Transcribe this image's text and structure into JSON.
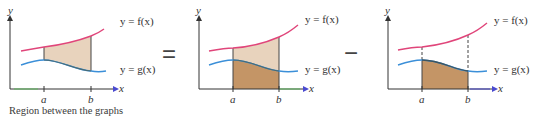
{
  "figure": {
    "caption": "Region between the graphs",
    "operators": {
      "equals": "=",
      "minus": "−"
    },
    "colors": {
      "f_curve": "#e0457a",
      "g_curve": "#3b8fd8",
      "region_light": "#e8d3bd",
      "region_dark": "#c49566",
      "axis": "#333333",
      "x_axis_accent_green": "#5db85d",
      "x_axis_arrow_blue": "#4a4ad0"
    },
    "panels": [
      {
        "id": "between",
        "description": "Region between the graphs",
        "axis_labels": {
          "x": "x",
          "y": "y"
        },
        "ticks": {
          "a": "a",
          "b": "b"
        },
        "curve_labels": {
          "f": "y = f(x)",
          "g": "y = g(x)"
        },
        "shading": "area between f and g on [a,b]"
      },
      {
        "id": "under_f",
        "description": "Area under f",
        "axis_labels": {
          "x": "x",
          "y": "y"
        },
        "ticks": {
          "a": "a",
          "b": "b"
        },
        "curve_labels": {
          "f": "y = f(x)",
          "g": "y = g(x)"
        },
        "shading": "area under f on [a,b]"
      },
      {
        "id": "under_g",
        "description": "Area under g",
        "axis_labels": {
          "x": "x",
          "y": "y"
        },
        "ticks": {
          "a": "a",
          "b": "b"
        },
        "curve_labels": {
          "f": "y = f(x)",
          "g": "y = g(x)"
        },
        "shading": "area under g on [a,b]"
      }
    ]
  }
}
